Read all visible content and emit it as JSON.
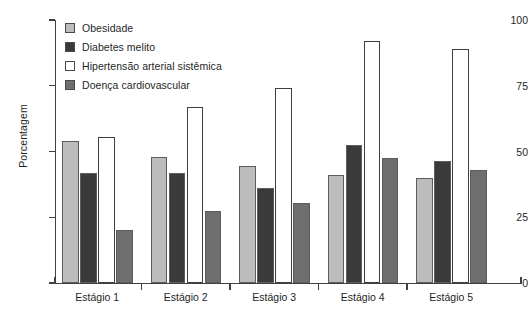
{
  "chart_data": {
    "type": "bar",
    "title": "",
    "subtitle": "",
    "xlabel": "",
    "ylabel": "Porcentagem",
    "ylim": [
      0,
      100
    ],
    "yticks": [
      0,
      25,
      50,
      75,
      100
    ],
    "ytick_labels": [
      "0",
      "25",
      "50",
      "75",
      "100"
    ],
    "grid": false,
    "legend_position": "top-left",
    "categories": [
      "Estágio 1",
      "Estágio 2",
      "Estágio 3",
      "Estágio 4",
      "Estágio 5"
    ],
    "series": [
      {
        "name": "Obesidade",
        "color": "#bcbcbc",
        "values": [
          54,
          48,
          44.5,
          41,
          40
        ]
      },
      {
        "name": "Diabetes melito",
        "color": "#3a3a3a",
        "values": [
          42,
          42,
          36,
          52.5,
          46.5
        ]
      },
      {
        "name": "Hipertensão arterial sistêmica",
        "color": "#ffffff",
        "values": [
          55.5,
          67,
          74,
          92,
          89
        ]
      },
      {
        "name": "Doença cardiovascular",
        "color": "#6e6e6e",
        "values": [
          20,
          27.5,
          30.5,
          47.5,
          43
        ]
      }
    ]
  },
  "legend": {
    "items": [
      {
        "label": "Obesidade",
        "color": "#bcbcbc"
      },
      {
        "label": "Diabetes melito",
        "color": "#3a3a3a"
      },
      {
        "label": "Hipertensão arterial sistêmica",
        "color": "#ffffff"
      },
      {
        "label": "Doença cardiovascular",
        "color": "#6e6e6e"
      }
    ]
  },
  "axes": {
    "y_title": "Porcentagem",
    "y_tick_labels": [
      "100",
      "75",
      "50",
      "25",
      "0"
    ],
    "x_tick_labels": [
      "Estágio 1",
      "Estágio 2",
      "Estágio 3",
      "Estágio 4",
      "Estágio 5"
    ]
  }
}
